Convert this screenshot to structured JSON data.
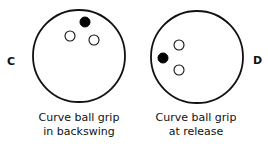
{
  "diagrams": [
    {
      "id": "C",
      "label": "C",
      "caption_line1": "Curve ball grip",
      "caption_line2": "in backswing",
      "ball": {
        "cx": 79,
        "cy": 56,
        "r": 46
      },
      "holes": [
        {
          "type": "thumb",
          "filled": true,
          "cx": 85,
          "cy": 22,
          "r": 5
        },
        {
          "type": "finger",
          "filled": false,
          "cx": 70,
          "cy": 36,
          "r": 5
        },
        {
          "type": "finger",
          "filled": false,
          "cx": 94,
          "cy": 40,
          "r": 5
        }
      ]
    },
    {
      "id": "D",
      "label": "D",
      "caption_line1": "Curve ball grip",
      "caption_line2": "at release",
      "ball": {
        "cx": 197,
        "cy": 57,
        "r": 46
      },
      "holes": [
        {
          "type": "thumb",
          "filled": true,
          "cx": 163,
          "cy": 58,
          "r": 5
        },
        {
          "type": "finger",
          "filled": false,
          "cx": 179,
          "cy": 45,
          "r": 5
        },
        {
          "type": "finger",
          "filled": false,
          "cx": 179,
          "cy": 70,
          "r": 5
        }
      ]
    }
  ],
  "colors": {
    "stroke": "#111111",
    "fill": "#ffffff",
    "thumb": "#000000"
  }
}
